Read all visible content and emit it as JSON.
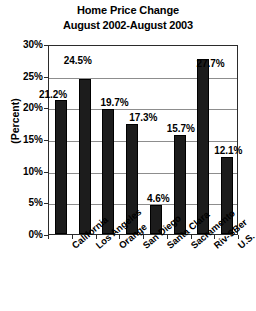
{
  "chart_data": {
    "type": "bar",
    "title": "Home Price Change",
    "subtitle": "August 2002-August 2003",
    "xlabel": "",
    "ylabel": "(Percent)",
    "ylim": [
      0,
      30
    ],
    "ytick_labels": [
      "0%",
      "5%",
      "10%",
      "15%",
      "20%",
      "25%",
      "30%"
    ],
    "ytick_values": [
      0,
      5,
      10,
      15,
      20,
      25,
      30
    ],
    "grid": true,
    "legend": "none",
    "categories": [
      "California",
      "Los Angeles",
      "Orange",
      "San Diego",
      "Santa Clara",
      "Sacramento",
      "Riv-SBer",
      "U.S."
    ],
    "values": [
      21.2,
      24.5,
      19.7,
      17.3,
      4.6,
      15.7,
      27.7,
      12.1
    ],
    "data_labels": [
      "21.2%",
      "24.5%",
      "19.7%",
      "17.3%",
      "4.6%",
      "15.7%",
      "27.7%",
      "12.1%"
    ],
    "bar_color": "#1c1c1c",
    "plot_background": "#ffffff",
    "gridline_color": "#8d8d8d",
    "axis_color": "#2b2b2b"
  }
}
